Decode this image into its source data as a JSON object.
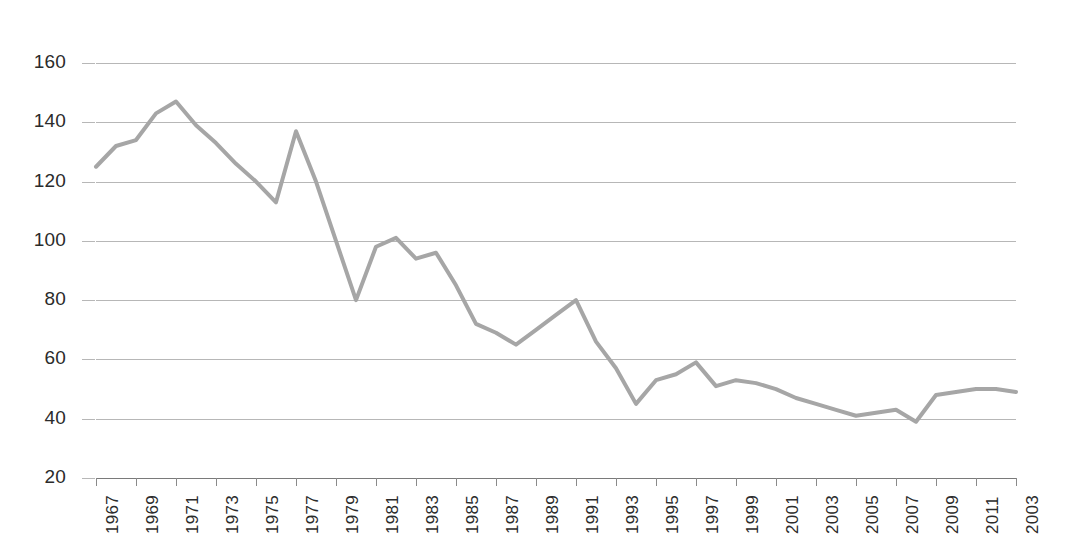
{
  "chart_data": {
    "type": "line",
    "title": "",
    "subtitle": "",
    "xlabel": "",
    "ylabel": "",
    "ylim": [
      20,
      160
    ],
    "ytick_labels": [
      "160",
      "140",
      "120",
      "100",
      "80",
      "60",
      "40",
      "20"
    ],
    "ytick_values": [
      160,
      140,
      120,
      100,
      80,
      60,
      40,
      20
    ],
    "grid": true,
    "legend": "none",
    "xtick_labels": [
      "1967",
      "1969",
      "1971",
      "1973",
      "1975",
      "1977",
      "1979",
      "1981",
      "1983",
      "1985",
      "1987",
      "1989",
      "1991",
      "1993",
      "1995",
      "1997",
      "1999",
      "2001",
      "2003",
      "2005",
      "2007",
      "2009",
      "2011",
      "2003"
    ],
    "x": [
      1967,
      1968,
      1969,
      1970,
      1971,
      1972,
      1973,
      1974,
      1975,
      1976,
      1977,
      1978,
      1979,
      1980,
      1981,
      1982,
      1983,
      1984,
      1985,
      1986,
      1987,
      1988,
      1989,
      1990,
      1991,
      1992,
      1993,
      1994,
      1995,
      1996,
      1997,
      1998,
      1999,
      2000,
      2001,
      2002,
      2003,
      2004,
      2005,
      2006,
      2007,
      2008,
      2009,
      2010,
      2011,
      2012,
      2013
    ],
    "values": [
      125,
      132,
      134,
      143,
      147,
      139,
      133,
      126,
      120,
      113,
      137,
      120,
      100,
      80,
      98,
      101,
      94,
      96,
      85,
      72,
      69,
      65,
      70,
      75,
      80,
      66,
      57,
      45,
      53,
      55,
      59,
      51,
      53,
      52,
      50,
      47,
      45,
      43,
      41,
      42,
      43,
      39,
      48,
      49,
      50,
      50,
      49
    ],
    "series": [
      {
        "name": "series-1",
        "color": "#a6a6a6",
        "values": [
          125,
          132,
          134,
          143,
          147,
          139,
          133,
          126,
          120,
          113,
          137,
          120,
          100,
          80,
          98,
          101,
          94,
          96,
          85,
          72,
          69,
          65,
          70,
          75,
          80,
          66,
          57,
          45,
          53,
          55,
          59,
          51,
          53,
          52,
          50,
          47,
          45,
          43,
          41,
          42,
          43,
          39,
          48,
          49,
          50,
          50,
          49
        ]
      }
    ],
    "colors": {
      "line": "#a6a6a6",
      "grid": "#b7b7b7",
      "axis": "#7a7a7a",
      "text": "#2b2b2b",
      "background": "#ffffff"
    },
    "line_width": 4
  }
}
